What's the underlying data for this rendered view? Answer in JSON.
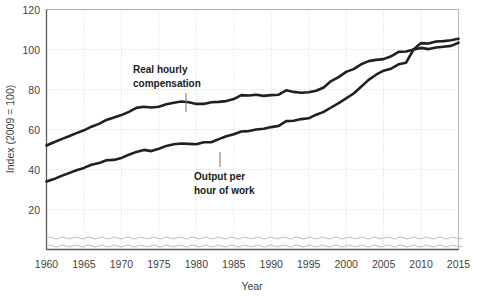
{
  "chart_data": {
    "type": "line",
    "title": "",
    "xlabel": "Year",
    "ylabel": "Index (2009 = 100)",
    "xlim": [
      1960,
      2015
    ],
    "ylim": [
      0,
      120
    ],
    "y_ticks": [
      20,
      40,
      60,
      80,
      100,
      120
    ],
    "x_ticks": [
      1960,
      1965,
      1970,
      1975,
      1980,
      1985,
      1990,
      1995,
      2000,
      2005,
      2010,
      2015
    ],
    "grid": "dotted",
    "legend_position": "inline-annotations",
    "axis_break": "wavy break near zero on y-axis",
    "x": [
      1960,
      1961,
      1962,
      1963,
      1964,
      1965,
      1966,
      1967,
      1968,
      1969,
      1970,
      1971,
      1972,
      1973,
      1974,
      1975,
      1976,
      1977,
      1978,
      1979,
      1980,
      1981,
      1982,
      1983,
      1984,
      1985,
      1986,
      1987,
      1988,
      1989,
      1990,
      1991,
      1992,
      1993,
      1994,
      1995,
      1996,
      1997,
      1998,
      1999,
      2000,
      2001,
      2002,
      2003,
      2004,
      2005,
      2006,
      2007,
      2008,
      2009,
      2010,
      2011,
      2012,
      2013,
      2014,
      2015
    ],
    "series": [
      {
        "name": "Real hourly compensation",
        "label_line1": "Real hourly",
        "label_line2": "compensation",
        "color": "#231f20",
        "values": [
          52.0,
          53.6,
          55.2,
          56.6,
          58.2,
          59.6,
          61.4,
          62.8,
          64.8,
          66.0,
          67.2,
          68.8,
          70.8,
          71.4,
          71.0,
          71.4,
          72.6,
          73.4,
          74.0,
          73.6,
          72.8,
          72.8,
          73.6,
          73.8,
          74.2,
          75.2,
          77.2,
          77.0,
          77.4,
          76.8,
          77.2,
          77.4,
          79.6,
          78.8,
          78.4,
          78.6,
          79.4,
          81.0,
          84.2,
          86.2,
          88.8,
          90.2,
          92.6,
          94.2,
          94.8,
          95.2,
          96.6,
          98.8,
          99.0,
          100.0,
          100.8,
          100.2,
          101.0,
          101.4,
          101.8,
          103.4
        ]
      },
      {
        "name": "Output per hour of work",
        "label_line1": "Output per",
        "label_line2": "hour of work",
        "color": "#231f20",
        "values": [
          34.0,
          35.2,
          36.8,
          38.2,
          39.6,
          40.8,
          42.4,
          43.2,
          44.6,
          44.8,
          45.8,
          47.4,
          48.8,
          49.8,
          49.2,
          50.4,
          51.8,
          52.6,
          53.0,
          52.8,
          52.6,
          53.6,
          53.6,
          55.2,
          56.6,
          57.6,
          59.0,
          59.2,
          60.0,
          60.4,
          61.2,
          61.8,
          64.2,
          64.4,
          65.2,
          65.6,
          67.4,
          68.8,
          71.0,
          73.2,
          75.6,
          78.0,
          81.4,
          84.8,
          87.4,
          89.4,
          90.4,
          92.6,
          93.4,
          100.0,
          103.2,
          103.0,
          104.0,
          104.2,
          104.6,
          105.4
        ]
      }
    ]
  },
  "axis": {
    "y_title": "Index (2009 = 100)",
    "x_title": "Year",
    "y_tick_labels": [
      "120",
      "100",
      "80",
      "60",
      "40",
      "20"
    ],
    "x_tick_labels": [
      "1960",
      "1965",
      "1970",
      "1975",
      "1980",
      "1985",
      "1990",
      "1995",
      "2000",
      "2005",
      "2010",
      "2015"
    ]
  },
  "annotations": [
    {
      "id": "real-hourly-compensation",
      "line1": "Real hourly",
      "line2": "compensation"
    },
    {
      "id": "output-per-hour-of-work",
      "line1": "Output per",
      "line2": "hour of work"
    }
  ],
  "colors": {
    "line": "#231f20",
    "grid": "#c9c9c9",
    "frame": "#b4b4b4",
    "axis": "#58595b",
    "text": "#3f3f3f",
    "background": "#ffffff"
  }
}
